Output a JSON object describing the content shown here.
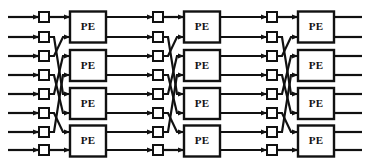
{
  "diagram": {
    "type": "butterfly-network",
    "node_label": "PE",
    "stage_count": 3,
    "row_count": 8,
    "pe_per_stage": 4,
    "switch_per_stage": 8,
    "colors": {
      "line": "#111111",
      "node_fill": "#ffffff",
      "node_stroke": "#111111",
      "background": "#ffffff"
    },
    "geometry": {
      "width": 369,
      "height": 158,
      "row_y": [
        17,
        37,
        56,
        75,
        94,
        113,
        132,
        150
      ],
      "stage_switch_x": [
        44,
        158,
        272
      ],
      "stage_pe_x": [
        88,
        202,
        316
      ],
      "pe_width": 36,
      "pe_height": 31,
      "switch_size": 10,
      "line_width": 2.2,
      "input_x": 8,
      "output_x": 362
    },
    "permutation": [
      0,
      4,
      1,
      5,
      2,
      6,
      3,
      7
    ],
    "straight_rows": [
      0,
      7
    ],
    "stages": [
      {
        "name": "stage-1",
        "switches": [
          "s1-0",
          "s1-1",
          "s1-2",
          "s1-3",
          "s1-4",
          "s1-5",
          "s1-6",
          "s1-7"
        ],
        "pes": [
          "PE",
          "PE",
          "PE",
          "PE"
        ]
      },
      {
        "name": "stage-2",
        "switches": [
          "s2-0",
          "s2-1",
          "s2-2",
          "s2-3",
          "s2-4",
          "s2-5",
          "s2-6",
          "s2-7"
        ],
        "pes": [
          "PE",
          "PE",
          "PE",
          "PE"
        ]
      },
      {
        "name": "stage-3",
        "switches": [
          "s3-0",
          "s3-1",
          "s3-2",
          "s3-3",
          "s3-4",
          "s3-5",
          "s3-6",
          "s3-7"
        ],
        "pes": [
          "PE",
          "PE",
          "PE",
          "PE"
        ]
      }
    ]
  }
}
